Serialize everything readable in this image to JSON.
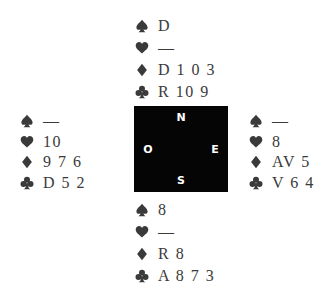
{
  "colors": {
    "suit_icon": "#3a3a3a",
    "card_text": "#3a3a3a",
    "compass_bg": "#050505",
    "compass_text": "#ffffff"
  },
  "compass": {
    "north": "N",
    "south": "S",
    "west": "O",
    "east": "E"
  },
  "hands": {
    "north": {
      "spades": "D",
      "hearts": "—",
      "diamonds": "D 1 0 3",
      "clubs": "R 10 9"
    },
    "west": {
      "spades": "—",
      "hearts": "10",
      "diamonds": "9 7 6",
      "clubs": "D 5 2"
    },
    "east": {
      "spades": "—",
      "hearts": "8",
      "diamonds": "AV 5",
      "clubs": "V 6 4"
    },
    "south": {
      "spades": "8",
      "hearts": "—",
      "diamonds": "R 8",
      "clubs": "A 8 7 3"
    }
  },
  "suits": [
    "spade-icon",
    "heart-icon",
    "diamond-icon",
    "club-icon"
  ]
}
